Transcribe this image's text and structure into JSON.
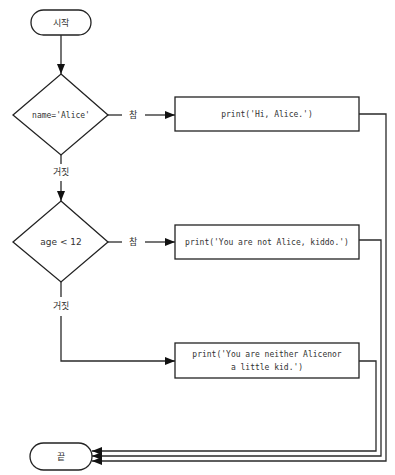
{
  "diagram": {
    "type": "flowchart",
    "nodes": {
      "start": {
        "kind": "terminal",
        "label": "시작"
      },
      "cond1": {
        "kind": "decision",
        "label": "name='Alice'"
      },
      "print1": {
        "kind": "process",
        "label": "print('Hi, Alice.')"
      },
      "cond2": {
        "kind": "decision",
        "label": "age < 12"
      },
      "print2": {
        "kind": "process",
        "label": "print('You are not Alice, kiddo.')"
      },
      "print3": {
        "kind": "process",
        "label_line1": "print('You are neither Alicenor",
        "label_line2": "a little kid.')"
      },
      "end": {
        "kind": "terminal",
        "label": "끝"
      }
    },
    "edge_labels": {
      "cond1_true": "참",
      "cond1_false": "거짓",
      "cond2_true": "참",
      "cond2_false": "거짓"
    },
    "edges": [
      {
        "from": "start",
        "to": "cond1"
      },
      {
        "from": "cond1",
        "to": "print1",
        "label": "참"
      },
      {
        "from": "cond1",
        "to": "cond2",
        "label": "거짓"
      },
      {
        "from": "cond2",
        "to": "print2",
        "label": "참"
      },
      {
        "from": "cond2",
        "to": "print3",
        "label": "거짓"
      },
      {
        "from": "print1",
        "to": "end"
      },
      {
        "from": "print2",
        "to": "end"
      },
      {
        "from": "print3",
        "to": "end"
      }
    ]
  }
}
